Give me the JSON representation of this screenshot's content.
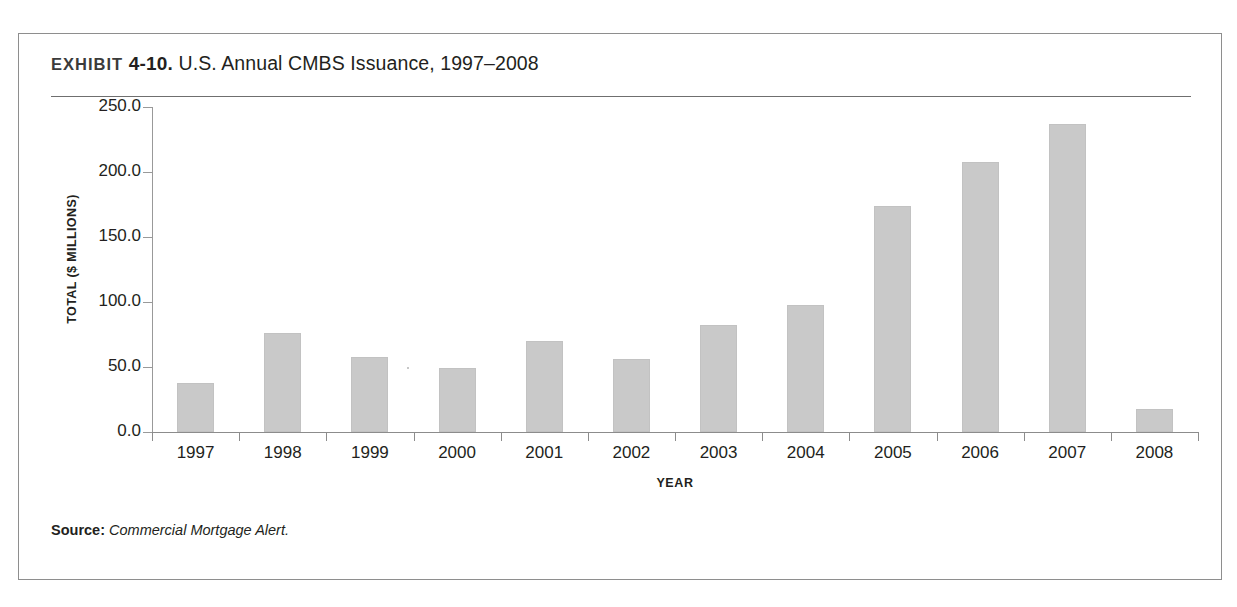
{
  "exhibit": {
    "label": "EXHIBIT",
    "number": "4-10.",
    "title": "U.S. Annual CMBS Issuance, 1997–2008"
  },
  "source": {
    "prefix": "Source:",
    "text": "Commercial Mortgage Alert."
  },
  "colors": {
    "bar_fill": "#c9c9c9",
    "axis": "#8c8c8c",
    "frame": "#8e8e8e",
    "text": "#231f20"
  },
  "chart_data": {
    "type": "bar",
    "title": "U.S. Annual CMBS Issuance, 1997–2008",
    "xlabel": "YEAR",
    "ylabel": "TOTAL ($ MILLIONS)",
    "categories": [
      "1997",
      "1998",
      "1999",
      "2000",
      "2001",
      "2002",
      "2003",
      "2004",
      "2005",
      "2006",
      "2007",
      "2008"
    ],
    "values": [
      38.0,
      76.0,
      58.0,
      49.0,
      70.0,
      56.0,
      82.0,
      98.0,
      174.0,
      208.0,
      237.0,
      18.0
    ],
    "ylim": [
      0,
      250
    ],
    "ytick_values": [
      0,
      50,
      100,
      150,
      200,
      250
    ],
    "ytick_labels": [
      "0.0",
      "50.0",
      "100.0",
      "150.0",
      "200.0",
      "250.0"
    ],
    "grid": false,
    "legend": false
  }
}
